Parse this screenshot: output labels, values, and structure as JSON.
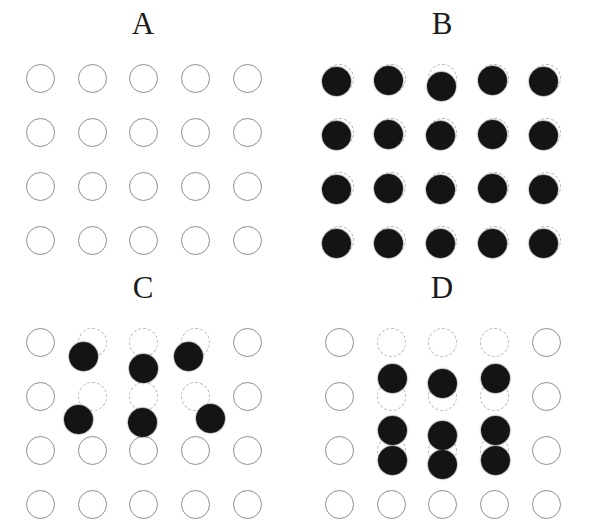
{
  "figure": {
    "width": 598,
    "height": 528,
    "background": "#ffffff",
    "dot_color": "#141414",
    "solid_outline_color": "#8f8f93",
    "dashed_outline_color": "#b9b9bd",
    "circle_diameter": 29,
    "dot_diameter": 29,
    "columns": 5,
    "rows": 4,
    "column_x": [
      40,
      92,
      143,
      195,
      247
    ],
    "row_y": [
      78,
      132,
      186,
      240
    ]
  },
  "panels": [
    {
      "id": "A",
      "label": "A",
      "origin": [
        0,
        0
      ],
      "label_x": 143,
      "sites": [
        {
          "col": 0,
          "row": 0,
          "style": "solid"
        },
        {
          "col": 1,
          "row": 0,
          "style": "solid"
        },
        {
          "col": 2,
          "row": 0,
          "style": "solid"
        },
        {
          "col": 3,
          "row": 0,
          "style": "solid"
        },
        {
          "col": 4,
          "row": 0,
          "style": "solid"
        },
        {
          "col": 0,
          "row": 1,
          "style": "solid"
        },
        {
          "col": 1,
          "row": 1,
          "style": "solid"
        },
        {
          "col": 2,
          "row": 1,
          "style": "solid"
        },
        {
          "col": 3,
          "row": 1,
          "style": "solid"
        },
        {
          "col": 4,
          "row": 1,
          "style": "solid"
        },
        {
          "col": 0,
          "row": 2,
          "style": "solid"
        },
        {
          "col": 1,
          "row": 2,
          "style": "solid"
        },
        {
          "col": 2,
          "row": 2,
          "style": "solid"
        },
        {
          "col": 3,
          "row": 2,
          "style": "solid"
        },
        {
          "col": 4,
          "row": 2,
          "style": "solid"
        },
        {
          "col": 0,
          "row": 3,
          "style": "solid"
        },
        {
          "col": 1,
          "row": 3,
          "style": "solid"
        },
        {
          "col": 2,
          "row": 3,
          "style": "solid"
        },
        {
          "col": 3,
          "row": 3,
          "style": "solid"
        },
        {
          "col": 4,
          "row": 3,
          "style": "solid"
        }
      ],
      "dots": []
    },
    {
      "id": "B",
      "label": "B",
      "origin": [
        299,
        0
      ],
      "label_x": 143,
      "sites": [
        {
          "col": 0,
          "row": 0,
          "style": "dashed"
        },
        {
          "col": 1,
          "row": 0,
          "style": "dashed"
        },
        {
          "col": 2,
          "row": 0,
          "style": "dashed"
        },
        {
          "col": 3,
          "row": 0,
          "style": "dashed"
        },
        {
          "col": 4,
          "row": 0,
          "style": "dashed"
        },
        {
          "col": 0,
          "row": 1,
          "style": "dashed"
        },
        {
          "col": 1,
          "row": 1,
          "style": "dashed"
        },
        {
          "col": 2,
          "row": 1,
          "style": "dashed"
        },
        {
          "col": 3,
          "row": 1,
          "style": "dashed"
        },
        {
          "col": 4,
          "row": 1,
          "style": "dashed"
        },
        {
          "col": 0,
          "row": 2,
          "style": "dashed"
        },
        {
          "col": 1,
          "row": 2,
          "style": "dashed"
        },
        {
          "col": 2,
          "row": 2,
          "style": "dashed"
        },
        {
          "col": 3,
          "row": 2,
          "style": "dashed"
        },
        {
          "col": 4,
          "row": 2,
          "style": "dashed"
        },
        {
          "col": 0,
          "row": 3,
          "style": "dashed"
        },
        {
          "col": 1,
          "row": 3,
          "style": "dashed"
        },
        {
          "col": 2,
          "row": 3,
          "style": "dashed"
        },
        {
          "col": 3,
          "row": 3,
          "style": "dashed"
        },
        {
          "col": 4,
          "row": 3,
          "style": "dashed"
        }
      ],
      "dots": [
        {
          "col": 0,
          "row": 0,
          "dx": -3,
          "dy": 3
        },
        {
          "col": 1,
          "row": 0,
          "dx": -3,
          "dy": 2
        },
        {
          "col": 2,
          "row": 0,
          "dx": -1,
          "dy": 8
        },
        {
          "col": 3,
          "row": 0,
          "dx": -2,
          "dy": 2
        },
        {
          "col": 4,
          "row": 0,
          "dx": -3,
          "dy": 3
        },
        {
          "col": 0,
          "row": 1,
          "dx": -3,
          "dy": 3
        },
        {
          "col": 1,
          "row": 1,
          "dx": -3,
          "dy": 2
        },
        {
          "col": 2,
          "row": 1,
          "dx": -2,
          "dy": 3
        },
        {
          "col": 3,
          "row": 1,
          "dx": -2,
          "dy": 2
        },
        {
          "col": 4,
          "row": 1,
          "dx": -3,
          "dy": 3
        },
        {
          "col": 0,
          "row": 2,
          "dx": -3,
          "dy": 3
        },
        {
          "col": 1,
          "row": 2,
          "dx": -3,
          "dy": 2
        },
        {
          "col": 2,
          "row": 2,
          "dx": -2,
          "dy": 3
        },
        {
          "col": 3,
          "row": 2,
          "dx": -2,
          "dy": 2
        },
        {
          "col": 4,
          "row": 2,
          "dx": -3,
          "dy": 3
        },
        {
          "col": 0,
          "row": 3,
          "dx": -3,
          "dy": 3
        },
        {
          "col": 1,
          "row": 3,
          "dx": -3,
          "dy": 3
        },
        {
          "col": 2,
          "row": 3,
          "dx": -2,
          "dy": 3
        },
        {
          "col": 3,
          "row": 3,
          "dx": -2,
          "dy": 3
        },
        {
          "col": 4,
          "row": 3,
          "dx": -3,
          "dy": 3
        }
      ]
    },
    {
      "id": "C",
      "label": "C",
      "origin": [
        0,
        264
      ],
      "label_x": 143,
      "sites": [
        {
          "col": 0,
          "row": 0,
          "style": "solid"
        },
        {
          "col": 1,
          "row": 0,
          "style": "dashed"
        },
        {
          "col": 2,
          "row": 0,
          "style": "dashed"
        },
        {
          "col": 3,
          "row": 0,
          "style": "dashed"
        },
        {
          "col": 4,
          "row": 0,
          "style": "solid"
        },
        {
          "col": 0,
          "row": 1,
          "style": "solid"
        },
        {
          "col": 1,
          "row": 1,
          "style": "dashed"
        },
        {
          "col": 2,
          "row": 1,
          "style": "dashed"
        },
        {
          "col": 3,
          "row": 1,
          "style": "dashed"
        },
        {
          "col": 4,
          "row": 1,
          "style": "solid"
        },
        {
          "col": 0,
          "row": 2,
          "style": "solid"
        },
        {
          "col": 1,
          "row": 2,
          "style": "solid"
        },
        {
          "col": 2,
          "row": 2,
          "style": "solid"
        },
        {
          "col": 3,
          "row": 2,
          "style": "solid"
        },
        {
          "col": 4,
          "row": 2,
          "style": "solid"
        },
        {
          "col": 0,
          "row": 3,
          "style": "solid"
        },
        {
          "col": 1,
          "row": 3,
          "style": "solid"
        },
        {
          "col": 2,
          "row": 3,
          "style": "solid"
        },
        {
          "col": 3,
          "row": 3,
          "style": "solid"
        },
        {
          "col": 4,
          "row": 3,
          "style": "solid"
        }
      ],
      "dots": [
        {
          "col": 1,
          "row": 0,
          "dx": -9,
          "dy": 14
        },
        {
          "col": 2,
          "row": 0,
          "dx": 0,
          "dy": 26
        },
        {
          "col": 3,
          "row": 0,
          "dx": -7,
          "dy": 14
        },
        {
          "col": 1,
          "row": 1,
          "dx": -14,
          "dy": 23
        },
        {
          "col": 2,
          "row": 1,
          "dx": -1,
          "dy": 26
        },
        {
          "col": 3,
          "row": 1,
          "dx": 15,
          "dy": 22
        }
      ]
    },
    {
      "id": "D",
      "label": "D",
      "origin": [
        299,
        264
      ],
      "label_x": 143,
      "sites": [
        {
          "col": 0,
          "row": 0,
          "style": "solid"
        },
        {
          "col": 1,
          "row": 0,
          "style": "dashed"
        },
        {
          "col": 2,
          "row": 0,
          "style": "dashed"
        },
        {
          "col": 3,
          "row": 0,
          "style": "dashed"
        },
        {
          "col": 4,
          "row": 0,
          "style": "solid"
        },
        {
          "col": 0,
          "row": 1,
          "style": "solid"
        },
        {
          "col": 1,
          "row": 1,
          "style": "dashed"
        },
        {
          "col": 2,
          "row": 1,
          "style": "dashed"
        },
        {
          "col": 3,
          "row": 1,
          "style": "dashed"
        },
        {
          "col": 4,
          "row": 1,
          "style": "solid"
        },
        {
          "col": 0,
          "row": 2,
          "style": "solid"
        },
        {
          "col": 1,
          "row": 2,
          "style": "dashed"
        },
        {
          "col": 2,
          "row": 2,
          "style": "dashed"
        },
        {
          "col": 3,
          "row": 2,
          "style": "dashed"
        },
        {
          "col": 4,
          "row": 2,
          "style": "solid"
        },
        {
          "col": 0,
          "row": 3,
          "style": "solid"
        },
        {
          "col": 1,
          "row": 3,
          "style": "solid"
        },
        {
          "col": 2,
          "row": 3,
          "style": "solid"
        },
        {
          "col": 3,
          "row": 3,
          "style": "solid"
        },
        {
          "col": 4,
          "row": 3,
          "style": "solid"
        }
      ],
      "dots": [
        {
          "col": 1,
          "row": 1,
          "dx": 1,
          "dy": -18
        },
        {
          "col": 2,
          "row": 1,
          "dx": 0,
          "dy": -13
        },
        {
          "col": 3,
          "row": 1,
          "dx": 1,
          "dy": -18
        },
        {
          "col": 1,
          "row": 2,
          "dx": 1,
          "dy": -20
        },
        {
          "col": 2,
          "row": 2,
          "dx": 0,
          "dy": -15
        },
        {
          "col": 3,
          "row": 2,
          "dx": 1,
          "dy": -20
        },
        {
          "col": 1,
          "row": 2,
          "dx": 1,
          "dy": 10
        },
        {
          "col": 2,
          "row": 2,
          "dx": 0,
          "dy": 14
        },
        {
          "col": 3,
          "row": 2,
          "dx": 1,
          "dy": 10
        }
      ]
    }
  ]
}
